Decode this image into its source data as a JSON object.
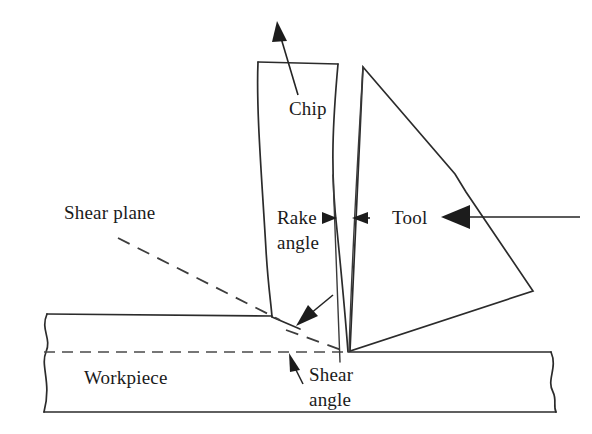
{
  "figure": {
    "background_color": "#ffffff",
    "line_color": "#2b2b2b",
    "text_color": "#1a1a1a",
    "width": 592,
    "height": 434
  },
  "labels": {
    "shear_plane": "Shear plane",
    "chip": "Chip",
    "rake_angle_line1": "Rake",
    "rake_angle_line2": "angle",
    "tool": "Tool",
    "workpiece": "Workpiece",
    "shear_angle_line1": "Shear",
    "shear_angle_line2": "angle"
  },
  "parts": {
    "workpiece": {
      "name": "Workpiece",
      "top_y": 314,
      "bottom_y": 412,
      "left_x": 35,
      "right_x": 560,
      "break_edges": "both",
      "cut_depth_line_y": 352
    },
    "chip": {
      "name": "Chip",
      "flow_direction": "up-right",
      "top_edge_from_x": 258,
      "top_edge_to_x": 338,
      "root_x": 272,
      "root_y": 317
    },
    "tool": {
      "name": "Tool",
      "shape": "wedge",
      "apex_x": 363,
      "apex_y": 67,
      "tip_x": 348,
      "tip_y": 352,
      "right_corner_x": 533,
      "right_corner_y": 291
    },
    "shear_plane": {
      "name": "Shear plane",
      "style": "dashed leader",
      "from_x": 120,
      "from_y": 238,
      "to_x": 348,
      "to_y": 352
    }
  },
  "annotations": {
    "chip_flow_arrow": "arrow pointing up-right out of the chip",
    "rake_angle_arrows": "two arrows pointing inward at the rake face gap",
    "tool_leader_arrow": "arrow pointing left at the tool body",
    "shear_angle_arrow": "arrow pointing up-left at the shear plane",
    "shear_zone_arrow": "arrow pointing down-left at the chip root"
  }
}
